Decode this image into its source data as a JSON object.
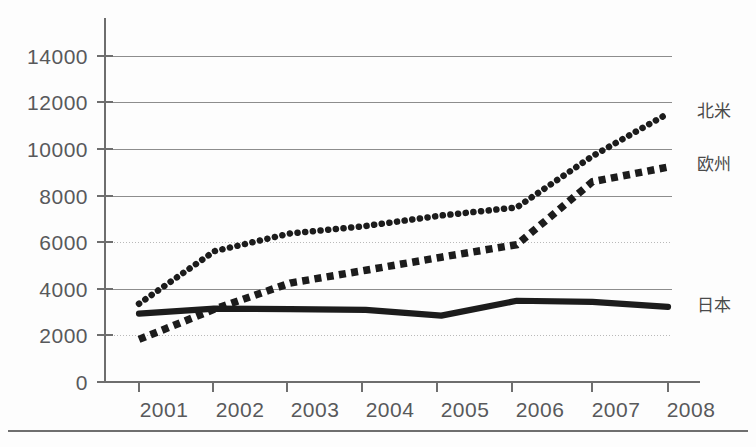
{
  "chart_data": {
    "type": "line",
    "title": "",
    "xlabel": "",
    "ylabel": "",
    "categories": [
      "2001",
      "2002",
      "2003",
      "2004",
      "2005",
      "2006",
      "2007",
      "2008"
    ],
    "ylim": [
      0,
      14000
    ],
    "y_ticks": [
      0,
      2000,
      4000,
      6000,
      8000,
      10000,
      12000,
      14000
    ],
    "grid": true,
    "legend_position": "right-inline",
    "series": [
      {
        "name": "北米",
        "style": "dotted",
        "values": [
          3360,
          5620,
          6380,
          6700,
          7150,
          7500,
          9700,
          11530
        ]
      },
      {
        "name": "欧州",
        "style": "dashed",
        "values": [
          1830,
          3130,
          4250,
          4800,
          5360,
          5900,
          8600,
          9230
        ]
      },
      {
        "name": "日本",
        "style": "solid",
        "values": [
          2940,
          3150,
          3130,
          3100,
          2850,
          3490,
          3440,
          3230
        ]
      }
    ]
  },
  "axis": {
    "y_tick_labels": [
      "14000",
      "12000",
      "10000",
      "8000",
      "6000",
      "4000",
      "2000",
      "0"
    ],
    "x_tick_labels": [
      "2001",
      "2002",
      "2003",
      "2004",
      "2005",
      "2006",
      "2007",
      "2008"
    ]
  },
  "legend": {
    "items": [
      {
        "label": "北米"
      },
      {
        "label": "欧州"
      },
      {
        "label": "日本"
      }
    ]
  },
  "colors": {
    "series_ink": "#1c1c1c",
    "grid": "#8d8d8d",
    "axis": "#6e6e6e",
    "text": "#58595b",
    "background": "#fdfdfd"
  }
}
